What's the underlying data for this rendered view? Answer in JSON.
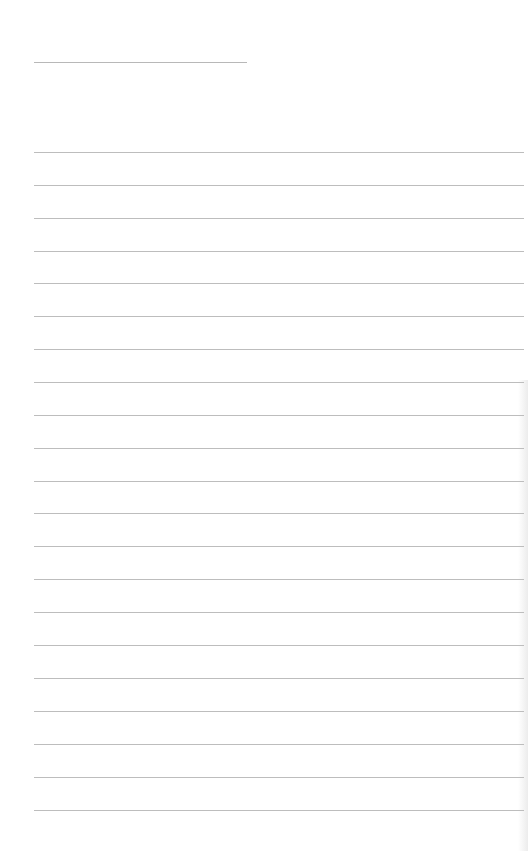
{
  "page": {
    "type": "lined-notepaper",
    "background_color": "#ffffff",
    "line_color": "#bdbdbd",
    "title_line": {
      "visible": true,
      "text": ""
    },
    "ruled_line_count": 21,
    "lines": [
      "",
      "",
      "",
      "",
      "",
      "",
      "",
      "",
      "",
      "",
      "",
      "",
      "",
      "",
      "",
      "",
      "",
      "",
      "",
      "",
      ""
    ]
  }
}
